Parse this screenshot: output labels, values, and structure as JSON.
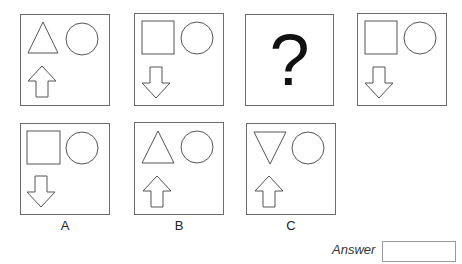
{
  "puzzle": {
    "sequence": [
      {
        "id": "seq-1",
        "top_shape": "triangle-up",
        "circle": true,
        "arrow": "up"
      },
      {
        "id": "seq-2",
        "top_shape": "square",
        "circle": true,
        "arrow": "down"
      },
      {
        "id": "seq-3",
        "placeholder": "?"
      },
      {
        "id": "seq-4",
        "top_shape": "square",
        "circle": true,
        "arrow": "down"
      }
    ],
    "options": [
      {
        "label": "A",
        "top_shape": "square",
        "circle": true,
        "arrow": "down"
      },
      {
        "label": "B",
        "top_shape": "triangle-up",
        "circle": true,
        "arrow": "up"
      },
      {
        "label": "C",
        "top_shape": "triangle-down",
        "circle": true,
        "arrow": "up"
      }
    ],
    "stroke_color": "#555555"
  },
  "answer": {
    "label": "Answer",
    "value": ""
  }
}
